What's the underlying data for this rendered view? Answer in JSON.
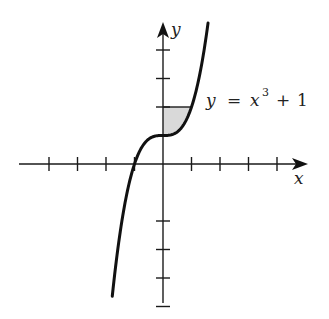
{
  "diagram": {
    "title": "",
    "axes": {
      "x_label": "x",
      "y_label": "y",
      "origin_px": [
        163,
        164
      ],
      "unit_px": 28.5,
      "x_ticks": [
        -4,
        -3,
        -2,
        -1,
        1,
        2,
        3,
        4
      ],
      "y_ticks": [
        -5,
        -4,
        -3,
        -2,
        2,
        3,
        4
      ]
    },
    "curve": {
      "equation_label": {
        "lhs": "y",
        "eq": "=",
        "base": "x",
        "exp": "3",
        "plus": "+",
        "const": "1"
      },
      "function": "x^3 + 1",
      "x_range": [
        -1.78,
        1.58
      ],
      "color": "#111111"
    },
    "shaded_region": {
      "description": "Region bounded by y-axis, y = 2, and curve y = x^3 + 1 for 0 <= x <= 1",
      "x_range": [
        0,
        1
      ],
      "y_top": 2,
      "color": "#d9d9d9"
    }
  }
}
